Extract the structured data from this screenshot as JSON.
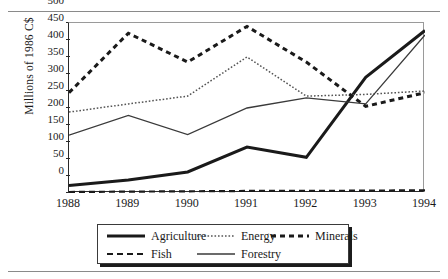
{
  "figure": {
    "ylabel": "Millions of 1986 C$"
  },
  "legend": {
    "entries": [
      {
        "label": "Agriculture",
        "style": "solid-thick",
        "color": "#1a1a1a"
      },
      {
        "label": "Energy",
        "style": "dotted",
        "color": "#5a5a5a"
      },
      {
        "label": "Minerals",
        "style": "dashed-thick",
        "color": "#1a1a1a"
      },
      {
        "label": "Fish",
        "style": "dashed",
        "color": "#1a1a1a"
      },
      {
        "label": "Forestry",
        "style": "solid-thin",
        "color": "#3a3a3a"
      }
    ]
  },
  "axes": {
    "yticks": [
      "0",
      "50",
      "100",
      "150",
      "200",
      "250",
      "300",
      "350",
      "400",
      "450",
      "500"
    ],
    "xticks": [
      "1988",
      "1989",
      "1990",
      "1991",
      "1992",
      "1993",
      "1994"
    ]
  },
  "chart_data": {
    "type": "line",
    "title": "",
    "xlabel": "",
    "ylabel": "Millions of 1986 C$",
    "categories": [
      1988,
      1989,
      1990,
      1991,
      1992,
      1993,
      1994
    ],
    "x": [
      "1988",
      "1989",
      "1990",
      "1991",
      "1992",
      "1993",
      "1994"
    ],
    "ylim": [
      0,
      500
    ],
    "ytick_step": 50,
    "grid": false,
    "legend_position": "bottom",
    "series": [
      {
        "name": "Agriculture",
        "style": "solid-thick",
        "values": [
          22,
          38,
          62,
          135,
          105,
          340,
          478
        ]
      },
      {
        "name": "Energy",
        "style": "dotted",
        "values": [
          238,
          262,
          285,
          400,
          285,
          290,
          300
        ]
      },
      {
        "name": "Minerals",
        "style": "dashed-thick",
        "values": [
          295,
          470,
          385,
          490,
          385,
          255,
          295
        ]
      },
      {
        "name": "Fish",
        "style": "dashed",
        "values": [
          3,
          4,
          5,
          6,
          6,
          7,
          8
        ]
      },
      {
        "name": "Forestry",
        "style": "solid-thin",
        "values": [
          170,
          228,
          172,
          250,
          280,
          262,
          465
        ]
      }
    ]
  }
}
